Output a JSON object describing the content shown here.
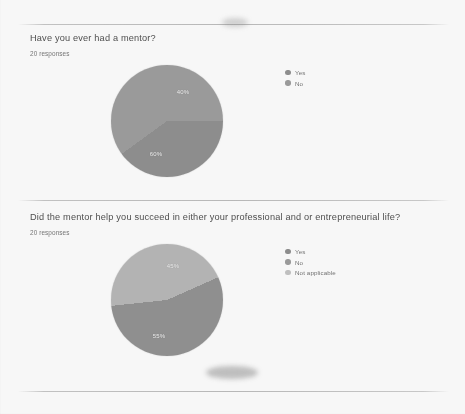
{
  "page": {
    "background_color": "#fdfdfd",
    "separator_color": "#bababa"
  },
  "palette": {
    "slice_dark": "#8c8c8c",
    "slice_mid": "#9a9a9a",
    "slice_light": "#b5b5b5",
    "label_text": "#f2f2f2",
    "title_text": "#4a4a4a",
    "muted_text": "#737373"
  },
  "sections": [
    {
      "question": "Have you ever had a mentor?",
      "responses": "20 responses",
      "legend": [
        {
          "label": "Yes",
          "color": "#8c8c8c"
        },
        {
          "label": "No",
          "color": "#9a9a9a"
        }
      ],
      "labels": [
        {
          "text": "40%",
          "x": 72,
          "y": 27
        },
        {
          "text": "60%",
          "x": 45,
          "y": 89
        }
      ]
    },
    {
      "question": "Did the mentor help you succeed in either your professional and or entrepreneurial life?",
      "responses": "20 responses",
      "legend": [
        {
          "label": "Yes",
          "color": "#8c8c8c"
        },
        {
          "label": "No",
          "color": "#9a9a9a"
        },
        {
          "label": "Not applicable",
          "color": "#c2c2c2"
        }
      ],
      "labels": [
        {
          "text": "45%",
          "x": 62,
          "y": 22
        },
        {
          "text": "55%",
          "x": 48,
          "y": 92
        }
      ]
    }
  ],
  "chart_data": [
    {
      "type": "pie",
      "title": "Have you ever had a mentor?",
      "subtitle": "20 responses",
      "categories": [
        "Yes",
        "No"
      ],
      "values": [
        40,
        60
      ],
      "value_labels": [
        "40%",
        "60%"
      ],
      "unit": "percent",
      "total_responses": 20,
      "colors": [
        "#8c8c8c",
        "#9a9a9a"
      ],
      "legend_position": "right",
      "grid": false
    },
    {
      "type": "pie",
      "title": "Did the mentor help you succeed in either your professional and or entrepreneurial life?",
      "subtitle": "20 responses",
      "categories": [
        "Yes",
        "No",
        "Not applicable"
      ],
      "values": [
        45,
        55,
        0
      ],
      "value_labels": [
        "45%",
        "55%",
        ""
      ],
      "unit": "percent",
      "total_responses": 20,
      "colors": [
        "#b5b5b5",
        "#8f8f8f",
        "#c2c2c2"
      ],
      "legend_position": "right",
      "grid": false
    }
  ]
}
